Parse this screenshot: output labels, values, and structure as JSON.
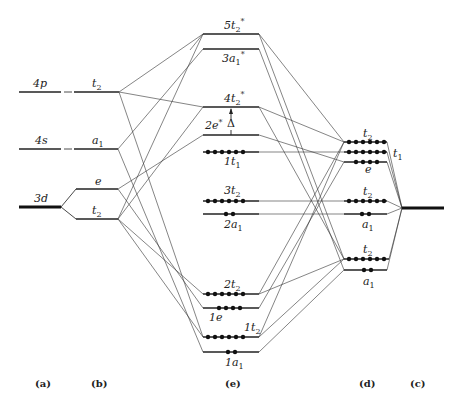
{
  "diagram": {
    "columns": {
      "a": {
        "label": "(a)",
        "levels": [
          {
            "name": "4p",
            "y": 92
          },
          {
            "name": "4s",
            "y": 149
          },
          {
            "name": "3d",
            "y": 207
          }
        ]
      },
      "b": {
        "label": "(b)",
        "levels": [
          {
            "name": "t",
            "sub": "2",
            "y": 92,
            "from": "4p"
          },
          {
            "name": "a",
            "sub": "1",
            "y": 149,
            "from": "4s"
          },
          {
            "name": "e",
            "y": 189,
            "from": "3d"
          },
          {
            "name": "t",
            "sub": "2",
            "y": 219,
            "from": "3d"
          }
        ]
      },
      "e": {
        "label": "(e)",
        "levels": [
          {
            "name": "5t",
            "sub": "2",
            "sup": "*",
            "y": 34,
            "electrons": 0
          },
          {
            "name": "3a",
            "sub": "1",
            "sup": "*",
            "y": 49,
            "electrons": 0
          },
          {
            "name": "4t",
            "sub": "2",
            "sup": "*",
            "y": 107,
            "electrons": 0
          },
          {
            "name": "2e",
            "sup": "*",
            "y": 135,
            "electrons": 0
          },
          {
            "name": "1t",
            "sub": "1",
            "y": 152,
            "electrons": 6
          },
          {
            "name": "3t",
            "sub": "2",
            "y": 201,
            "electrons": 6
          },
          {
            "name": "2a",
            "sub": "1",
            "y": 214,
            "electrons": 2
          },
          {
            "name": "2t",
            "sub": "2",
            "y": 294,
            "electrons": 6
          },
          {
            "name": "1e",
            "y": 308,
            "electrons": 4
          },
          {
            "name": "1t",
            "sub": "2",
            "y": 337,
            "electrons": 6
          },
          {
            "name": "1a",
            "sub": "1",
            "y": 352,
            "electrons": 2
          }
        ],
        "gap_label": "Δ"
      },
      "d": {
        "label": "(d)",
        "levels": [
          {
            "name": "t",
            "sub": "2",
            "y": 142,
            "electrons": 6
          },
          {
            "name": "t",
            "sub": "1",
            "y": 152,
            "electrons": 6,
            "label_side": "right"
          },
          {
            "name": "e",
            "y": 162,
            "electrons": 4
          },
          {
            "name": "t",
            "sub": "2",
            "y": 201,
            "electrons": 6
          },
          {
            "name": "a",
            "sub": "1",
            "y": 214,
            "electrons": 2
          },
          {
            "name": "t",
            "sub": "2",
            "y": 259,
            "electrons": 6
          },
          {
            "name": "a",
            "sub": "1",
            "y": 270,
            "electrons": 2
          }
        ]
      },
      "c": {
        "label": "(c)",
        "levels": [
          {
            "name": "ligand",
            "y": 208
          }
        ]
      }
    }
  }
}
